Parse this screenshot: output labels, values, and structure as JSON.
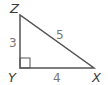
{
  "diagram": {
    "type": "right-triangle",
    "vertices": [
      {
        "name": "Z",
        "x": 20,
        "y": 15,
        "label_x": 10,
        "label_y": 13
      },
      {
        "name": "Y",
        "x": 20,
        "y": 68,
        "label_x": 8,
        "label_y": 82,
        "right_angle": true
      },
      {
        "name": "X",
        "x": 94,
        "y": 68,
        "label_x": 92,
        "label_y": 82
      }
    ],
    "sides": [
      {
        "between": "ZY",
        "length": "3",
        "label_x": 9,
        "label_y": 47
      },
      {
        "between": "ZX",
        "length": "5",
        "label_x": 56,
        "label_y": 39
      },
      {
        "between": "YX",
        "length": "4",
        "label_x": 53,
        "label_y": 82
      }
    ],
    "colors": {
      "stroke": "#555555",
      "label": "#3a3a3a",
      "number": "#777777"
    }
  }
}
